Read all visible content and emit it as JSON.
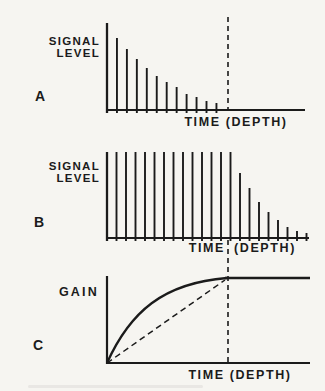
{
  "canvas": {
    "width": 325,
    "height": 391,
    "paper_color": "#f6f5f1",
    "ink_color": "#1b1b1b"
  },
  "guide": {
    "description": "vertical dashed reference line shared by all three panels marking the time/depth where signal reaches noise floor and gain saturates",
    "x": 228,
    "dash": "5 4",
    "segments": [
      {
        "y1": 17,
        "y2": 110
      },
      {
        "y1": 240,
        "y2": 364
      }
    ]
  },
  "panels": {
    "a": {
      "letter": "A",
      "ylabel_line1": "SIGNAL",
      "ylabel_line2": "LEVEL",
      "xlabel": "TIME (DEPTH)"
    },
    "b": {
      "letter": "B",
      "ylabel_line1": "SIGNAL",
      "ylabel_line2": "LEVEL",
      "xlabel_left": "TIME",
      "xlabel_right": "(DEPTH)"
    },
    "c": {
      "letter": "C",
      "ylabel": "GAIN",
      "xlabel": "TIME (DEPTH)"
    }
  },
  "chart_data": [
    {
      "panel": "A",
      "type": "bar",
      "title": "",
      "ylabel": "SIGNAL LEVEL",
      "xlabel": "TIME (DEPTH)",
      "description": "echo amplitude spikes decaying exponentially with time/depth, reaching zero at the dashed reference line; flat baseline continues beyond it",
      "values_px": [
        87,
        72,
        61,
        51,
        42,
        34,
        28,
        23,
        16,
        13,
        9,
        7
      ],
      "units": "arbitrary signal level (pixel heights, unlabeled axis)",
      "x_start_px": 107,
      "x_step_px": 9.95,
      "baseline_y_px": 110,
      "axis_x_end_px": 305,
      "spike_overshoot_px": 3
    },
    {
      "panel": "B",
      "type": "bar",
      "title": "",
      "ylabel": "SIGNAL LEVEL",
      "xlabel": "TIME (DEPTH)",
      "description": "signal after time-varied gain: constant full-level spikes up to the dashed reference time, then decaying spikes",
      "values_px": [
        86,
        86,
        86,
        86,
        86,
        86,
        86,
        86,
        86,
        86,
        86,
        86,
        86,
        86,
        65,
        50,
        36,
        26,
        18,
        11,
        7,
        5
      ],
      "units": "arbitrary signal level (pixel heights, unlabeled axis)",
      "x_start_px": 107,
      "x_step_px": 9.5,
      "baseline_y_px": 238,
      "axis_x_end_px": 309,
      "spike_overshoot_px": 3
    },
    {
      "panel": "C",
      "type": "line",
      "title": "",
      "ylabel": "GAIN",
      "xlabel": "TIME (DEPTH)",
      "description": "applied gain rises along a saturating (exponential-like) curve from zero, reaching maximum at the dashed reference time, then stays constant; dashed straight diagonal shows linear-gain reference from origin to the saturation point",
      "y_axis_px": {
        "x": 107,
        "top": 276
      },
      "baseline_y_px": 363,
      "axis_x_end_px": 310,
      "curve_px": {
        "start": [
          107,
          363
        ],
        "c1": [
          130,
          312
        ],
        "c2": [
          163,
          283
        ],
        "end": [
          227,
          278
        ],
        "flat_to_x": 310
      },
      "diagonal_dashed_px": {
        "from": [
          107,
          363
        ],
        "to": [
          225,
          280
        ],
        "dash": "6 4"
      }
    }
  ],
  "artifacts": {
    "bottom_smudge": "faint horizontal scan smudge near bottom-left edge"
  }
}
